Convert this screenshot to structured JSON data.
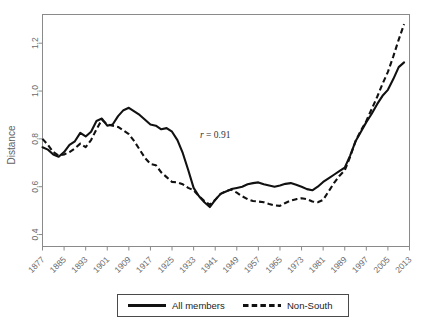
{
  "chart_data": {
    "type": "line",
    "title": "",
    "xlabel": "",
    "ylabel": "Distance",
    "ylim": [
      0.35,
      1.32
    ],
    "xlim": [
      1877,
      2013
    ],
    "grid": false,
    "legend_position": "bottom",
    "annotations": [
      {
        "name": "correlation",
        "prefix": "r",
        "text": " = 0.91",
        "x": 1941,
        "y": 0.815
      }
    ],
    "ytick_labels": [
      "0.4",
      "0.6",
      "0.8",
      "1.0",
      "1.2"
    ],
    "ytick_values": [
      0.4,
      0.6,
      0.8,
      1.0,
      1.2
    ],
    "xtick_labels": [
      "1877",
      "1885",
      "1893",
      "1901",
      "1909",
      "1917",
      "1925",
      "1933",
      "1941",
      "1949",
      "1957",
      "1965",
      "1973",
      "1981",
      "1989",
      "1997",
      "2005",
      "2013"
    ],
    "xtick_values": [
      1877,
      1885,
      1893,
      1901,
      1909,
      1917,
      1925,
      1933,
      1941,
      1949,
      1957,
      1965,
      1973,
      1981,
      1989,
      1997,
      2005,
      2013
    ],
    "x": [
      1877,
      1879,
      1881,
      1883,
      1885,
      1887,
      1889,
      1891,
      1893,
      1895,
      1897,
      1899,
      1901,
      1903,
      1905,
      1907,
      1909,
      1911,
      1913,
      1915,
      1917,
      1919,
      1921,
      1923,
      1925,
      1927,
      1929,
      1931,
      1933,
      1935,
      1937,
      1939,
      1941,
      1943,
      1945,
      1947,
      1949,
      1951,
      1953,
      1955,
      1957,
      1959,
      1961,
      1963,
      1965,
      1967,
      1969,
      1971,
      1973,
      1975,
      1977,
      1979,
      1981,
      1983,
      1985,
      1987,
      1989,
      1991,
      1993,
      1995,
      1997,
      1999,
      2001,
      2003,
      2005,
      2007,
      2009,
      2011
    ],
    "series": [
      {
        "name": "All members",
        "style": "solid",
        "values": [
          0.765,
          0.755,
          0.735,
          0.725,
          0.745,
          0.775,
          0.79,
          0.825,
          0.81,
          0.83,
          0.875,
          0.885,
          0.855,
          0.86,
          0.895,
          0.92,
          0.93,
          0.915,
          0.9,
          0.88,
          0.86,
          0.855,
          0.84,
          0.845,
          0.83,
          0.795,
          0.74,
          0.67,
          0.595,
          0.56,
          0.535,
          0.515,
          0.545,
          0.57,
          0.58,
          0.59,
          0.595,
          0.6,
          0.61,
          0.615,
          0.618,
          0.61,
          0.605,
          0.6,
          0.605,
          0.612,
          0.615,
          0.608,
          0.6,
          0.59,
          0.585,
          0.6,
          0.62,
          0.635,
          0.65,
          0.665,
          0.68,
          0.73,
          0.79,
          0.83,
          0.87,
          0.905,
          0.945,
          0.98,
          1.005,
          1.05,
          1.1,
          1.12
        ]
      },
      {
        "name": "Non-South",
        "style": "dashed",
        "values": [
          0.8,
          0.775,
          0.745,
          0.73,
          0.735,
          0.745,
          0.76,
          0.78,
          0.765,
          0.795,
          0.84,
          0.88,
          0.86,
          0.855,
          0.85,
          0.835,
          0.82,
          0.79,
          0.755,
          0.72,
          0.695,
          0.69,
          0.66,
          0.64,
          0.62,
          0.618,
          0.61,
          0.595,
          0.585,
          0.56,
          0.54,
          0.525,
          0.545,
          0.57,
          0.582,
          0.588,
          0.575,
          0.56,
          0.548,
          0.54,
          0.538,
          0.535,
          0.528,
          0.522,
          0.52,
          0.532,
          0.542,
          0.548,
          0.552,
          0.548,
          0.538,
          0.535,
          0.545,
          0.58,
          0.615,
          0.645,
          0.668,
          0.725,
          0.79,
          0.835,
          0.875,
          0.925,
          0.975,
          1.03,
          1.08,
          1.145,
          1.215,
          1.28
        ]
      }
    ]
  },
  "legend": {
    "items": [
      {
        "label": "All members",
        "style": "solid"
      },
      {
        "label": "Non-South",
        "style": "dashed"
      }
    ]
  },
  "axes": {
    "y_title": "Distance"
  }
}
